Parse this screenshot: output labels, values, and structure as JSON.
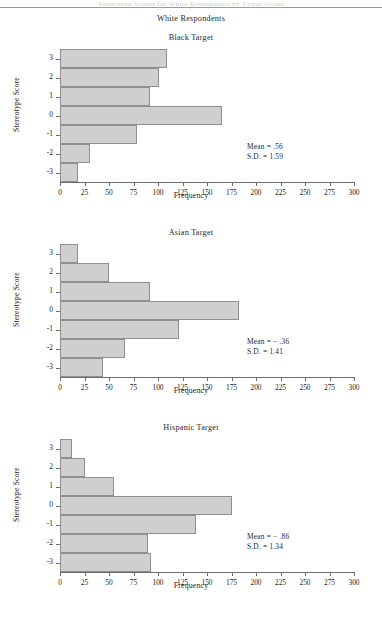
{
  "page": {
    "running_head": "Stereotype Scores for White Respondents by Target Group",
    "heading": "White Respondents"
  },
  "axis": {
    "x_label": "Frequency",
    "y_label": "Stereotype Score",
    "x_ticks": [
      "0",
      "25",
      "50",
      "75",
      "100",
      "125",
      "150",
      "175",
      "200",
      "225",
      "250",
      "275",
      "300"
    ],
    "y_ticks": [
      "3",
      "2",
      "1",
      "0",
      "-1",
      "-2",
      "-3"
    ]
  },
  "figures": [
    {
      "title": "Black Target",
      "mean_label": "Mean = .56",
      "sd_label": "S.D. = 1.59"
    },
    {
      "title": "Asian Target",
      "mean_label": "Mean = − .36",
      "sd_label": "S.D. = 1.41"
    },
    {
      "title": "Hispanic Target",
      "mean_label": "Mean = − .86",
      "sd_label": "S.D. = 1.34"
    }
  ],
  "chart_data": [
    {
      "type": "bar",
      "orientation": "horizontal",
      "title": "Black Target",
      "xlabel": "Frequency",
      "ylabel": "Stereotype Score",
      "categories": [
        "3",
        "2",
        "1",
        "0",
        "-1",
        "-2",
        "-3"
      ],
      "values": [
        109,
        101,
        92,
        165,
        79,
        31,
        18
      ],
      "xlim": [
        0,
        300
      ],
      "xticks": [
        0,
        25,
        50,
        75,
        100,
        125,
        150,
        175,
        200,
        225,
        250,
        275,
        300
      ],
      "grid": false,
      "legend": "none",
      "annotations": [
        "Mean = .56",
        "S.D. = 1.59"
      ],
      "bar_color": "#cfcfcf",
      "bar_edge_color": "#8f8f8f"
    },
    {
      "type": "bar",
      "orientation": "horizontal",
      "title": "Asian Target",
      "xlabel": "Frequency",
      "ylabel": "Stereotype Score",
      "categories": [
        "3",
        "2",
        "1",
        "0",
        "-1",
        "-2",
        "-3"
      ],
      "values": [
        18,
        50,
        92,
        183,
        121,
        66,
        44
      ],
      "xlim": [
        0,
        300
      ],
      "xticks": [
        0,
        25,
        50,
        75,
        100,
        125,
        150,
        175,
        200,
        225,
        250,
        275,
        300
      ],
      "grid": false,
      "legend": "none",
      "annotations": [
        "Mean = − .36",
        "S.D. = 1.41"
      ],
      "bar_color": "#cfcfcf",
      "bar_edge_color": "#8f8f8f"
    },
    {
      "type": "bar",
      "orientation": "horizontal",
      "title": "Hispanic Target",
      "xlabel": "Frequency",
      "ylabel": "Stereotype Score",
      "categories": [
        "3",
        "2",
        "1",
        "0",
        "-1",
        "-2",
        "-3"
      ],
      "values": [
        12,
        26,
        55,
        175,
        139,
        90,
        93
      ],
      "xlim": [
        0,
        300
      ],
      "xticks": [
        0,
        25,
        50,
        75,
        100,
        125,
        150,
        175,
        200,
        225,
        250,
        275,
        300
      ],
      "grid": false,
      "legend": "none",
      "annotations": [
        "Mean = − .86",
        "S.D. = 1.34"
      ],
      "bar_color": "#cfcfcf",
      "bar_edge_color": "#8f8f8f"
    }
  ]
}
